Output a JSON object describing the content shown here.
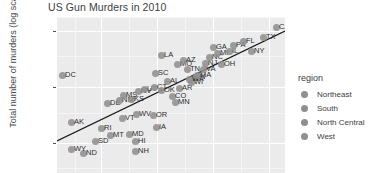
{
  "chart_data": {
    "type": "scatter",
    "title": "US Gun Murders in 2010",
    "xlabel": "",
    "ylabel": "Total number of murders (log scale)",
    "y_scale": "log10",
    "ylim": [
      4,
      2000
    ],
    "xlim": [
      0,
      40000000
    ],
    "grid": true,
    "legend_position": "right",
    "y_ticks": [
      "1000",
      "100",
      "10"
    ],
    "legend": {
      "title": "region",
      "entries": [
        {
          "label": "Northeast",
          "color": "#8f8f8f"
        },
        {
          "label": "South",
          "color": "#8f8f8f"
        },
        {
          "label": "North Central",
          "color": "#8f8f8f"
        },
        {
          "label": "West",
          "color": "#8f8f8f"
        }
      ]
    },
    "trend_line": {
      "type": "linear-fit-log",
      "x_start_px": 0,
      "y_start_px": 124,
      "x_end_px": 228,
      "y_end_px": 14
    },
    "points": [
      {
        "label": "DC",
        "px": 5,
        "py": 58,
        "region": "South",
        "murders": 99,
        "population": 601723
      },
      {
        "label": "DE",
        "px": 50,
        "py": 86,
        "region": "South",
        "murders": 38,
        "population": 897934
      },
      {
        "label": "AK",
        "px": 14,
        "py": 105,
        "region": "West",
        "murders": 19,
        "population": 710231
      },
      {
        "label": "RI",
        "px": 44,
        "py": 111,
        "region": "Northeast",
        "murders": 16,
        "population": 1052567
      },
      {
        "label": "MT",
        "px": 53,
        "py": 118,
        "region": "West",
        "murders": 12,
        "population": 989415
      },
      {
        "label": "VT",
        "px": 65,
        "py": 101,
        "region": "Northeast",
        "murders": 8,
        "population": 625741
      },
      {
        "label": "SD",
        "px": 38,
        "py": 124,
        "region": "North Central",
        "murders": 8,
        "population": 814180
      },
      {
        "label": "ND",
        "px": 26,
        "py": 136,
        "region": "North Central",
        "murders": 4,
        "population": 672591
      },
      {
        "label": "WY",
        "px": 14,
        "py": 132,
        "region": "West",
        "murders": 5,
        "population": 563626
      },
      {
        "label": "HI",
        "px": 78,
        "py": 124,
        "region": "West",
        "murders": 7,
        "population": 1360301
      },
      {
        "label": "NH",
        "px": 78,
        "py": 134,
        "region": "Northeast",
        "murders": 5,
        "population": 1316470
      },
      {
        "label": "MD",
        "px": 72,
        "py": 117,
        "region": "South",
        "murders": 293,
        "population": 5773552
      },
      {
        "label": "WV",
        "px": 79,
        "py": 97,
        "region": "South",
        "murders": 27,
        "population": 1852994
      },
      {
        "label": "IA",
        "px": 99,
        "py": 110,
        "region": "North Central",
        "murders": 21,
        "population": 3046355
      },
      {
        "label": "OR",
        "px": 96,
        "py": 98,
        "region": "West",
        "murders": 36,
        "population": 3831074
      },
      {
        "label": "NM",
        "px": 62,
        "py": 83,
        "region": "West",
        "murders": 67,
        "population": 2059179
      },
      {
        "label": "KS",
        "px": 74,
        "py": 82,
        "region": "North Central",
        "murders": 63,
        "population": 2853118
      },
      {
        "label": "MS",
        "px": 66,
        "py": 78,
        "region": "South",
        "murders": 120,
        "population": 2967297
      },
      {
        "label": "NV",
        "px": 81,
        "py": 74,
        "region": "West",
        "murders": 84,
        "population": 2700551
      },
      {
        "label": "UT",
        "px": 87,
        "py": 72,
        "region": "West",
        "murders": 44,
        "population": 2763885
      },
      {
        "label": "CT",
        "px": 97,
        "py": 70,
        "region": "Northeast",
        "murders": 97,
        "population": 3574097
      },
      {
        "label": "OK",
        "px": 104,
        "py": 73,
        "region": "South",
        "murders": 111,
        "population": 3751351
      },
      {
        "label": "CO",
        "px": 115,
        "py": 79,
        "region": "West",
        "murders": 65,
        "population": 5029196
      },
      {
        "label": "MN",
        "px": 118,
        "py": 85,
        "region": "North Central",
        "murders": 53,
        "population": 5303925
      },
      {
        "label": "AL",
        "px": 110,
        "py": 64,
        "region": "South",
        "murders": 135,
        "population": 4779736
      },
      {
        "label": "AR",
        "px": 122,
        "py": 71,
        "region": "South",
        "murders": 93,
        "population": 2915918
      },
      {
        "label": "SC",
        "px": 98,
        "py": 56,
        "region": "South",
        "murders": 207,
        "population": 4625364
      },
      {
        "label": "LA",
        "px": 104,
        "py": 38,
        "region": "South",
        "murders": 351,
        "population": 4533372
      },
      {
        "label": "MO",
        "px": 120,
        "py": 47,
        "region": "South",
        "murders": 321,
        "population": 5988927
      },
      {
        "label": "TN",
        "px": 130,
        "py": 52,
        "region": "South",
        "murders": 219,
        "population": 6346105
      },
      {
        "label": "IN",
        "px": 138,
        "py": 60,
        "region": "North Central",
        "murders": 142,
        "population": 6483802
      },
      {
        "label": "WI",
        "px": 134,
        "py": 65,
        "region": "North Central",
        "murders": 97,
        "population": 5686986
      },
      {
        "label": "AZ",
        "px": 126,
        "py": 43,
        "region": "West",
        "murders": 232,
        "population": 6392017
      },
      {
        "label": "WA",
        "px": 132,
        "py": 62,
        "region": "West",
        "murders": 93,
        "population": 6724540
      },
      {
        "label": "MA",
        "px": 140,
        "py": 58,
        "region": "Northeast",
        "murders": 118,
        "population": 6547629
      },
      {
        "label": "VA",
        "px": 146,
        "py": 52,
        "region": "South",
        "murders": 250,
        "population": 8001024
      },
      {
        "label": "NJ",
        "px": 148,
        "py": 46,
        "region": "Northeast",
        "murders": 246,
        "population": 8791894
      },
      {
        "label": "NC",
        "px": 152,
        "py": 40,
        "region": "South",
        "murders": 286,
        "population": 9535483
      },
      {
        "label": "MI",
        "px": 160,
        "py": 36,
        "region": "North Central",
        "murders": 413,
        "population": 9883640
      },
      {
        "label": "GA",
        "px": 156,
        "py": 30,
        "region": "South",
        "murders": 376,
        "population": 9920000
      },
      {
        "label": "OH",
        "px": 164,
        "py": 47,
        "region": "North Central",
        "murders": 310,
        "population": 11536504
      },
      {
        "label": "IL",
        "px": 172,
        "py": 34,
        "region": "North Central",
        "murders": 364,
        "population": 12830632
      },
      {
        "label": "PA",
        "px": 176,
        "py": 28,
        "region": "Northeast",
        "murders": 457,
        "population": 12702379
      },
      {
        "label": "FL",
        "px": 186,
        "py": 24,
        "region": "South",
        "murders": 669,
        "population": 19687653
      },
      {
        "label": "NY",
        "px": 194,
        "py": 34,
        "region": "Northeast",
        "murders": 517,
        "population": 19378102
      },
      {
        "label": "TX",
        "px": 206,
        "py": 20,
        "region": "South",
        "murders": 805,
        "population": 25145561
      },
      {
        "label": "CA",
        "px": 219,
        "py": 10,
        "region": "West",
        "murders": 1257,
        "population": 37253956
      }
    ]
  }
}
